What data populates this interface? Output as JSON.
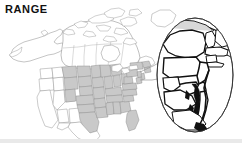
{
  "figure": {
    "title": "RANGE",
    "type": "species-range-map",
    "region": "North America",
    "background_color": "#ffffff",
    "title_color": "#111111"
  },
  "legend_colors": {
    "range_fill": "#c9c9c9",
    "non_range_fill": "#ffffff",
    "outline": "#8a8a8a",
    "inset_outline": "#111111",
    "inset_frame": "#333333",
    "leader_line": "#9a9a9a",
    "bottom_band": "#e9e9e9"
  },
  "main_map": {
    "name": "north-america-range-map",
    "shaded_label": "range",
    "unshaded_label": "outside range",
    "countries": [
      "Canada",
      "United States",
      "Mexico"
    ],
    "range_states": [
      "Montana",
      "North Dakota",
      "South Dakota",
      "Nebraska",
      "Kansas",
      "Oklahoma",
      "Texas",
      "Minnesota",
      "Iowa",
      "Missouri",
      "Arkansas",
      "Louisiana",
      "Wisconsin",
      "Illinois",
      "Michigan",
      "Indiana",
      "Ohio",
      "Kentucky",
      "Tennessee",
      "Mississippi",
      "Alabama",
      "Georgia",
      "Florida",
      "South Carolina",
      "North Carolina",
      "Virginia",
      "West Virginia",
      "Pennsylvania",
      "New York",
      "Maryland",
      "Delaware",
      "New Jersey",
      "Wyoming",
      "Colorado"
    ],
    "non_range_states": [
      "Alaska",
      "Washington",
      "Oregon",
      "California",
      "Nevada",
      "Idaho",
      "Utah",
      "Arizona",
      "New Mexico"
    ]
  },
  "inset": {
    "name": "mid-atlantic-inset",
    "shape": "oval",
    "description": "Magnified mid-Atlantic and Northeast detail",
    "states": [
      "New York",
      "Pennsylvania",
      "New Jersey",
      "Maryland",
      "Delaware",
      "Virginia",
      "West Virginia",
      "Connecticut",
      "Rhode Island",
      "Massachusetts",
      "Vermont",
      "New Hampshire"
    ],
    "features": [
      "Chesapeake Bay",
      "Delmarva Peninsula",
      "Long Island",
      "Cape Cod"
    ]
  },
  "connector": {
    "name": "inset-leader-line",
    "from": "main-map-mid-atlantic",
    "to": "inset-oval"
  }
}
